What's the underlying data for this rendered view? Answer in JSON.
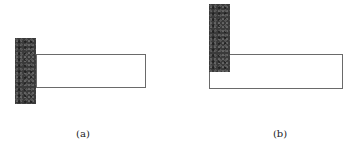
{
  "figure": {
    "panels": [
      {
        "id": "a",
        "label": "(a)",
        "description": "Dark support block on the left with a horizontal beam attached at its mid-height",
        "support": {
          "x": 15,
          "y": 38,
          "w": 21,
          "h": 66,
          "color": "#3a3a3a"
        },
        "beam": {
          "x": 36,
          "y": 54,
          "w": 110,
          "h": 34,
          "stroke": "#6a6a6a"
        },
        "label_pos": {
          "x": 83,
          "y": 128
        }
      },
      {
        "id": "b",
        "label": "(b)",
        "description": "Dark support block overlapping the top-left corner of a horizontal beam",
        "support": {
          "x": 209,
          "y": 4,
          "w": 21,
          "h": 68,
          "color": "#3a3a3a"
        },
        "beam": {
          "x": 209,
          "y": 54,
          "w": 134,
          "h": 35,
          "stroke": "#6a6a6a"
        },
        "label_pos": {
          "x": 280,
          "y": 128
        }
      }
    ]
  }
}
